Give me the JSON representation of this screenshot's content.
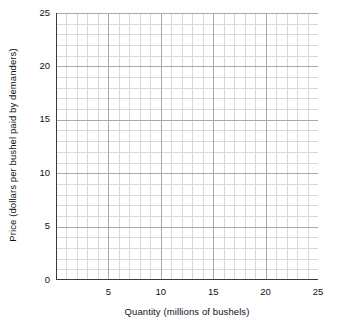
{
  "chart_data": {
    "type": "line",
    "title": "",
    "subtitle": "",
    "xlabel": "Quantity (millions of bushels)",
    "ylabel": "Price (dollars per bushel paid by demanders)",
    "xlim": [
      0,
      25
    ],
    "ylim": [
      0,
      25
    ],
    "x_major_ticks": [
      0,
      5,
      10,
      15,
      20,
      25
    ],
    "x_major_tick_labels": [
      "",
      "5",
      "10",
      "15",
      "20",
      "25"
    ],
    "y_major_ticks": [
      0,
      5,
      10,
      15,
      20,
      25
    ],
    "y_major_tick_labels": [
      "0",
      "5",
      "10",
      "15",
      "20",
      "25"
    ],
    "x_minor_step": 1,
    "y_minor_step": 1,
    "grid": true,
    "grid_minor": true,
    "legend": null,
    "legend_position": "none",
    "series": [],
    "annotations": []
  },
  "axes": {
    "y_ticks": [
      {
        "value": 25,
        "label": "25"
      },
      {
        "value": 20,
        "label": "20"
      },
      {
        "value": 15,
        "label": "15"
      },
      {
        "value": 10,
        "label": "10"
      },
      {
        "value": 5,
        "label": "5"
      },
      {
        "value": 0,
        "label": "0"
      }
    ],
    "x_ticks": [
      {
        "value": 5,
        "label": "5"
      },
      {
        "value": 10,
        "label": "10"
      },
      {
        "value": 15,
        "label": "15"
      },
      {
        "value": 20,
        "label": "20"
      },
      {
        "value": 25,
        "label": "25"
      }
    ]
  },
  "colors": {
    "background": "#ffffff",
    "axis_line": "#3a3a3a",
    "grid_major": "#a9a9a9",
    "grid_minor": "#d8d8d8",
    "text": "#111111"
  }
}
